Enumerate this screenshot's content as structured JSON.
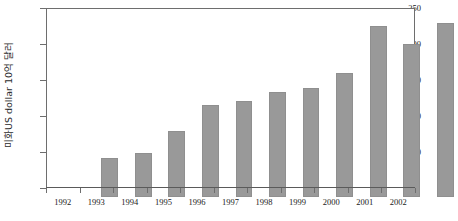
{
  "chart_data": {
    "type": "bar",
    "title": "",
    "xlabel": "",
    "ylabel": "미화US dollar 10억 달러",
    "categories": [
      "1992",
      "1993",
      "1994",
      "1995",
      "1996",
      "1997",
      "1998",
      "1999",
      "2000",
      "2001",
      "2002"
    ],
    "values": [
      54,
      61,
      92,
      128,
      133,
      146,
      152,
      172,
      238,
      213,
      242
    ],
    "ylim": [
      0,
      250
    ],
    "yticks": [
      0,
      50,
      100,
      150,
      200,
      250
    ],
    "ytick_labels": [
      "",
      "50",
      "100",
      "150",
      "200",
      "250"
    ],
    "grid": false,
    "legend": null,
    "bar_color": "#999999",
    "axis_color": "#6e6e6e",
    "background_color": "#ffffff"
  }
}
